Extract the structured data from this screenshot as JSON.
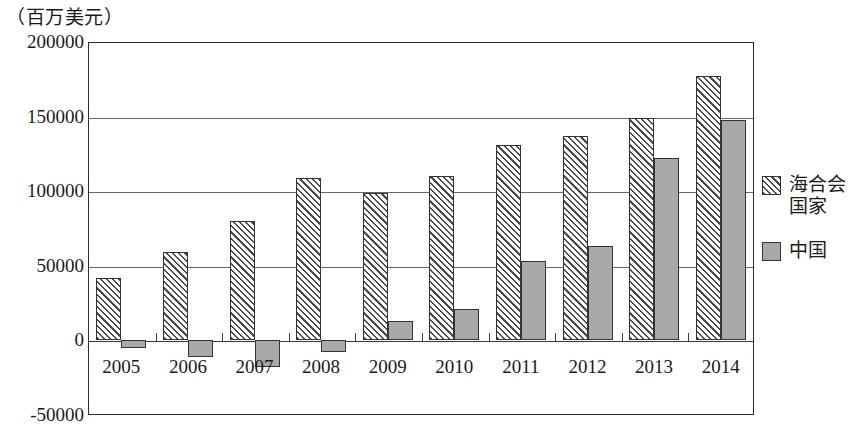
{
  "chart_data": {
    "type": "bar",
    "title": "（百万美元）",
    "subtitle": "",
    "xlabel": "",
    "ylabel": "",
    "unit_label": "（百万美元）",
    "categories": [
      "2005",
      "2006",
      "2007",
      "2008",
      "2009",
      "2010",
      "2011",
      "2012",
      "2013",
      "2014"
    ],
    "series": [
      {
        "name": "海合会国家",
        "fill": "diagonal-hatch",
        "values": [
          42000,
          59000,
          80000,
          109000,
          99000,
          110000,
          131000,
          137000,
          149000,
          177000
        ]
      },
      {
        "name": "中国",
        "fill": "solid-gray",
        "values": [
          -5000,
          -11000,
          -18000,
          -8000,
          13000,
          21000,
          53000,
          63000,
          122000,
          148000
        ]
      }
    ],
    "ylim": [
      -50000,
      200000
    ],
    "ytick_values": [
      200000,
      150000,
      100000,
      50000,
      0,
      -50000
    ],
    "ytick_labels": [
      "200000",
      "150000",
      "100000",
      "50000",
      "0",
      "-50000"
    ],
    "grid": true,
    "legend_position": "right",
    "colors": {
      "gcc_hatch": "#4a4a4a",
      "china_fill": "#a9a9a9",
      "bar_outline": "#333333",
      "axis": "#2b2b2b",
      "gridline": "#666666",
      "background": "#ffffff"
    }
  },
  "legend": {
    "entries": [
      {
        "label": "海合会国家",
        "swatch": "gcc"
      },
      {
        "label": "中国",
        "swatch": "china"
      }
    ]
  }
}
